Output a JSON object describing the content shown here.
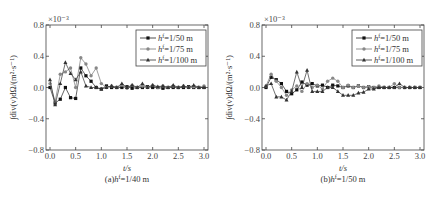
{
  "chart_data": [
    {
      "type": "line",
      "title": "",
      "caption": "(a)h^f=1/40 m",
      "xlabel": "t/s",
      "ylabel": "∫div(v)dΩ/(m²·s⁻¹)",
      "y_multiplier": "×10⁻³",
      "xlim": [
        0,
        3.0
      ],
      "ylim": [
        -0.8,
        0.8
      ],
      "xticks": [
        "0.0",
        "0.5",
        "1.0",
        "1.5",
        "2.0",
        "2.5",
        "3.0"
      ],
      "yticks": [
        "0.8",
        "0.4",
        "0.0",
        "-0.4",
        "-0.8"
      ],
      "legend_position": "upper right",
      "series": [
        {
          "name": "h^f=1/50 m",
          "marker": "square",
          "x": [
            0.0,
            0.1,
            0.2,
            0.3,
            0.4,
            0.5,
            0.6,
            0.7,
            0.8,
            0.9,
            1.0,
            1.1,
            1.2,
            1.3,
            1.4,
            1.5,
            1.6,
            1.7,
            1.8,
            1.9,
            2.0,
            2.1,
            2.2,
            2.3,
            2.4,
            2.5,
            2.6,
            2.7,
            2.8,
            2.9,
            3.0
          ],
          "values": [
            0.0,
            -0.2,
            -0.15,
            0.0,
            -0.13,
            -0.14,
            0.25,
            0.15,
            0.08,
            0.0,
            -0.02,
            0.02,
            0.0,
            0.0,
            0.0,
            0.01,
            -0.01,
            0.0,
            0.0,
            0.01,
            0.0,
            0.0,
            -0.01,
            0.0,
            0.0,
            0.0,
            0.0,
            0.01,
            0.0,
            0.0,
            0.0
          ]
        },
        {
          "name": "h^f=1/75 m",
          "marker": "circle",
          "x": [
            0.0,
            0.1,
            0.2,
            0.3,
            0.4,
            0.5,
            0.6,
            0.7,
            0.8,
            0.9,
            1.0,
            1.1,
            1.2,
            1.3,
            1.4,
            1.5,
            1.6,
            1.7,
            1.8,
            1.9,
            2.0,
            2.1,
            2.2,
            2.3,
            2.4,
            2.5,
            2.6,
            2.7,
            2.8,
            2.9,
            3.0
          ],
          "values": [
            0.05,
            -0.18,
            0.17,
            0.2,
            0.25,
            0.0,
            0.38,
            0.3,
            0.15,
            0.25,
            0.05,
            0.0,
            0.02,
            0.0,
            0.03,
            -0.01,
            0.03,
            0.0,
            0.02,
            0.0,
            0.03,
            0.0,
            0.02,
            0.0,
            0.02,
            0.0,
            0.02,
            0.0,
            0.01,
            0.0,
            0.02
          ]
        },
        {
          "name": "h^f=1/100 m",
          "marker": "triangle",
          "x": [
            0.0,
            0.1,
            0.2,
            0.3,
            0.4,
            0.5,
            0.6,
            0.7,
            0.8,
            0.9,
            1.0,
            1.1,
            1.2,
            1.3,
            1.4,
            1.5,
            1.6,
            1.7,
            1.8,
            1.9,
            2.0,
            2.1,
            2.2,
            2.3,
            2.4,
            2.5,
            2.6,
            2.7,
            2.8,
            2.9,
            3.0
          ],
          "values": [
            0.1,
            -0.22,
            0.05,
            0.32,
            0.18,
            0.1,
            0.2,
            0.02,
            0.0,
            0.0,
            -0.02,
            0.0,
            0.02,
            0.0,
            0.05,
            0.0,
            0.03,
            0.0,
            0.05,
            0.0,
            0.03,
            0.01,
            0.02,
            0.0,
            0.03,
            0.0,
            0.02,
            0.0,
            0.03,
            0.0,
            0.0
          ]
        }
      ]
    },
    {
      "type": "line",
      "title": "",
      "caption": "(b)h^f=1/50 m",
      "xlabel": "t/s",
      "ylabel": "∫div(v)dΩ/(m²·s⁻¹)",
      "y_multiplier": "×10⁻³",
      "xlim": [
        0,
        3.0
      ],
      "ylim": [
        -0.8,
        0.8
      ],
      "xticks": [
        "0.0",
        "0.5",
        "1.0",
        "1.5",
        "2.0",
        "2.5",
        "3.0"
      ],
      "yticks": [
        "0.8",
        "0.4",
        "0.0",
        "-0.4",
        "-0.8"
      ],
      "legend_position": "upper right",
      "series": [
        {
          "name": "h^f=1/50 m",
          "marker": "square",
          "x": [
            0.0,
            0.1,
            0.2,
            0.3,
            0.4,
            0.5,
            0.6,
            0.7,
            0.8,
            0.9,
            1.0,
            1.1,
            1.2,
            1.3,
            1.4,
            1.5,
            1.6,
            1.7,
            1.8,
            1.9,
            2.0,
            2.1,
            2.2,
            2.3,
            2.4,
            2.5,
            2.6,
            2.7,
            2.8,
            2.9,
            3.0
          ],
          "values": [
            0.0,
            0.13,
            0.1,
            0.05,
            -0.05,
            -0.08,
            -0.03,
            0.07,
            0.03,
            0.05,
            0.02,
            0.03,
            0.0,
            0.03,
            0.02,
            0.0,
            0.02,
            0.0,
            0.02,
            0.0,
            0.01,
            0.0,
            0.0,
            0.0,
            0.0,
            0.0,
            0.0,
            0.0,
            0.0,
            0.0,
            0.0
          ]
        },
        {
          "name": "h^f=1/75 m",
          "marker": "circle",
          "x": [
            0.0,
            0.1,
            0.2,
            0.3,
            0.4,
            0.5,
            0.6,
            0.7,
            0.8,
            0.9,
            1.0,
            1.1,
            1.2,
            1.3,
            1.4,
            1.5,
            1.6,
            1.7,
            1.8,
            1.9,
            2.0,
            2.1,
            2.2,
            2.3,
            2.4,
            2.5,
            2.6,
            2.7,
            2.8,
            2.9,
            3.0
          ],
          "values": [
            0.02,
            0.17,
            0.08,
            0.0,
            -0.1,
            -0.03,
            0.02,
            -0.05,
            0.05,
            0.0,
            0.03,
            -0.02,
            0.08,
            0.12,
            0.08,
            0.0,
            0.03,
            0.0,
            0.02,
            0.0,
            0.01,
            0.0,
            0.02,
            0.0,
            0.0,
            0.05,
            0.0,
            0.0,
            0.0,
            0.0,
            0.0
          ]
        },
        {
          "name": "h^f=1/100 m",
          "marker": "triangle",
          "x": [
            0.0,
            0.1,
            0.2,
            0.3,
            0.4,
            0.5,
            0.6,
            0.7,
            0.8,
            0.9,
            1.0,
            1.1,
            1.2,
            1.3,
            1.4,
            1.5,
            1.6,
            1.7,
            1.8,
            1.9,
            2.0,
            2.1,
            2.2,
            2.3,
            2.4,
            2.5,
            2.6,
            2.7,
            2.8,
            2.9,
            3.0
          ],
          "values": [
            0.02,
            0.05,
            -0.12,
            -0.12,
            -0.16,
            -0.05,
            0.2,
            0.0,
            0.22,
            -0.05,
            -0.05,
            -0.05,
            0.0,
            0.0,
            -0.05,
            -0.1,
            -0.1,
            -0.1,
            -0.07,
            -0.06,
            -0.02,
            -0.02,
            0.0,
            0.0,
            0.0,
            0.0,
            0.05,
            0.0,
            0.0,
            0.0,
            0.0
          ]
        }
      ]
    }
  ]
}
